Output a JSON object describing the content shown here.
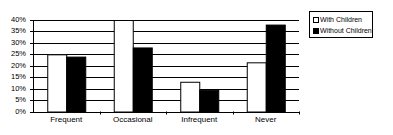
{
  "chart_data": {
    "type": "bar",
    "title": "",
    "xlabel": "",
    "ylabel": "",
    "categories": [
      "Frequent",
      "Occasional",
      "Infrequent",
      "Never"
    ],
    "series": [
      {
        "name": "With Children",
        "color": "#ffffff",
        "values": [
          25,
          40,
          13,
          21.5
        ]
      },
      {
        "name": "Without Children",
        "color": "#000000",
        "values": [
          24,
          28,
          9.5,
          38
        ]
      }
    ],
    "ylim": [
      0,
      40
    ],
    "yticks": [
      "0%",
      "5%",
      "10%",
      "15%",
      "20%",
      "25%",
      "30%",
      "35%",
      "40%"
    ],
    "ytick_values": [
      0,
      5,
      10,
      15,
      20,
      25,
      30,
      35,
      40
    ],
    "grid": true,
    "legend_position": "top-right"
  },
  "legend": {
    "items": [
      {
        "label": "With Children",
        "color": "#ffffff"
      },
      {
        "label": "Without Children",
        "color": "#000000"
      }
    ]
  }
}
